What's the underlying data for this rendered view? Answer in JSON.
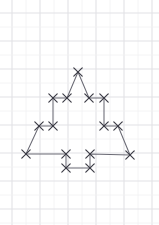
{
  "canvas": {
    "width": 159,
    "height": 225,
    "background": "#ffffff"
  },
  "paper": {
    "name": "graph-paper",
    "description": "Light blue-grey squared graph paper background",
    "grid_origin_x": 12,
    "grid_origin_y": 13,
    "grid_spacing": 14.0,
    "minor_color": "#f1f1f3",
    "major_color": "#e2e2e6",
    "columns": 11,
    "rows": 16
  },
  "figure": {
    "name": "fir-tree-polygon",
    "edge_color": "#6b6b75",
    "marker_color": "#3a3a44",
    "marker_glyph": "x",
    "marker_size": 4.2,
    "closed": true,
    "vertices": [
      {
        "label": "apex",
        "x": 78,
        "y": 72
      },
      {
        "label": "tier1-right-in",
        "x": 89,
        "y": 98
      },
      {
        "label": "tier1-right-out",
        "x": 104,
        "y": 98
      },
      {
        "label": "tier2-right-in",
        "x": 104,
        "y": 126
      },
      {
        "label": "tier2-right-out",
        "x": 118,
        "y": 126
      },
      {
        "label": "base-right",
        "x": 130,
        "y": 155
      },
      {
        "label": "trunk-top-right",
        "x": 90,
        "y": 154
      },
      {
        "label": "trunk-bot-right",
        "x": 90,
        "y": 168
      },
      {
        "label": "trunk-bot-left",
        "x": 66,
        "y": 168
      },
      {
        "label": "trunk-top-left",
        "x": 66,
        "y": 154
      },
      {
        "label": "base-left",
        "x": 26,
        "y": 154
      },
      {
        "label": "tier2-left-out",
        "x": 39,
        "y": 126
      },
      {
        "label": "tier2-left-in",
        "x": 53,
        "y": 126
      },
      {
        "label": "tier1-left-out",
        "x": 53,
        "y": 98
      },
      {
        "label": "tier1-left-in",
        "x": 67,
        "y": 98
      }
    ]
  }
}
